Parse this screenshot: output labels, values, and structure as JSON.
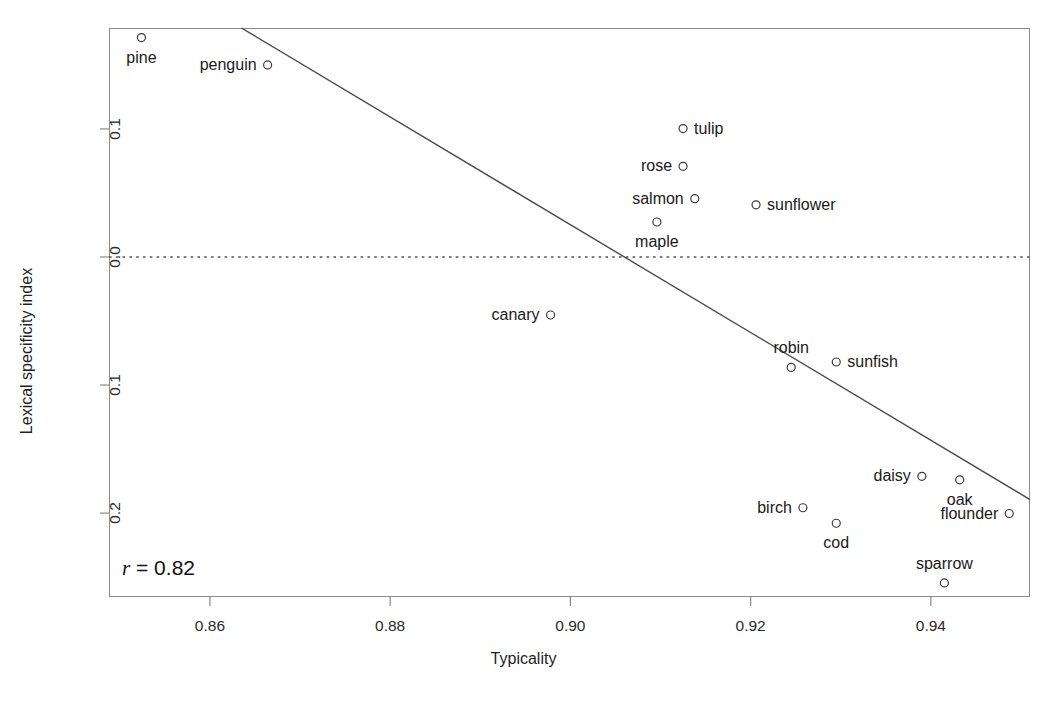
{
  "chart_data": {
    "type": "scatter",
    "title": "",
    "xlabel": "Typicality",
    "ylabel": "Lexical specificity index",
    "xlim": [
      0.8488,
      0.951
    ],
    "ylim": [
      -0.2655,
      0.1788
    ],
    "xticks": [
      0.86,
      0.88,
      0.9,
      0.92,
      0.94
    ],
    "xticklabels": [
      "0.86",
      "0.88",
      "0.90",
      "0.92",
      "0.94"
    ],
    "yticks": [
      0.1,
      0.0,
      -0.1,
      -0.2
    ],
    "yticklabels": [
      "0.1",
      "0.0",
      "0.1",
      "0.2"
    ],
    "grid": false,
    "legend": null,
    "annotations": [
      {
        "name": "correlation",
        "symbol": "r",
        "text": " = 0.82",
        "value": 0.82
      }
    ],
    "reference_lines": [
      {
        "name": "zero-line",
        "orientation": "horizontal",
        "y": 0.0,
        "style": "dotted"
      }
    ],
    "fit_line": {
      "name": "regression-line",
      "style": "solid",
      "x_start": 0.8635,
      "y_start": 0.1788,
      "x_end": 0.951,
      "y_end": -0.1894
    },
    "points": [
      {
        "label": "pine",
        "x": 0.8524,
        "y": 0.1713,
        "label_pos": "below"
      },
      {
        "label": "penguin",
        "x": 0.8664,
        "y": 0.15,
        "label_pos": "left"
      },
      {
        "label": "tulip",
        "x": 0.9125,
        "y": 0.1003,
        "label_pos": "right"
      },
      {
        "label": "rose",
        "x": 0.9125,
        "y": 0.0708,
        "label_pos": "left"
      },
      {
        "label": "salmon",
        "x": 0.9138,
        "y": 0.0455,
        "label_pos": "left"
      },
      {
        "label": "maple",
        "x": 0.9096,
        "y": 0.0273,
        "label_pos": "below"
      },
      {
        "label": "sunflower",
        "x": 0.9206,
        "y": 0.0407,
        "label_pos": "right"
      },
      {
        "label": "canary",
        "x": 0.8978,
        "y": -0.0453,
        "label_pos": "left"
      },
      {
        "label": "robin",
        "x": 0.9245,
        "y": -0.0862,
        "label_pos": "above"
      },
      {
        "label": "sunfish",
        "x": 0.9295,
        "y": -0.082,
        "label_pos": "right"
      },
      {
        "label": "daisy",
        "x": 0.939,
        "y": -0.1713,
        "label_pos": "left"
      },
      {
        "label": "oak",
        "x": 0.9432,
        "y": -0.174,
        "label_pos": "below"
      },
      {
        "label": "flounder",
        "x": 0.9487,
        "y": -0.2003,
        "label_pos": "left"
      },
      {
        "label": "birch",
        "x": 0.9258,
        "y": -0.1958,
        "label_pos": "left"
      },
      {
        "label": "cod",
        "x": 0.9295,
        "y": -0.2079,
        "label_pos": "below"
      },
      {
        "label": "sparrow",
        "x": 0.9415,
        "y": -0.2545,
        "label_pos": "above"
      }
    ],
    "marker": {
      "shape": "circle-open",
      "radius": 4,
      "color": "#3a3a3a"
    },
    "colors": {
      "frame": "#8a8a8a",
      "fit_line": "#4a4a4a",
      "zero_line": "#555555",
      "text": "#1a1a1a",
      "background": "#ffffff"
    }
  }
}
